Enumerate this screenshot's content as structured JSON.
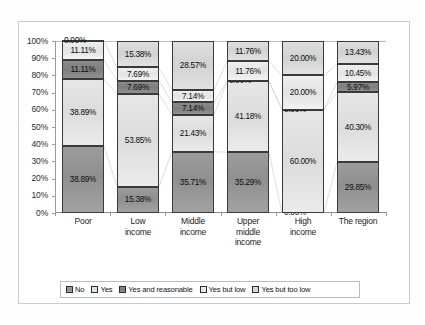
{
  "chart_data": {
    "type": "bar",
    "stacked": true,
    "title": "",
    "subtitle": "",
    "xlabel": "",
    "ylabel": "",
    "ylim": [
      0,
      100
    ],
    "grid": false,
    "legend_position": "bottom",
    "value_format": "percent",
    "categories": [
      "Poor",
      "Low income",
      "Middle income",
      "Upper middle income",
      "High income",
      "The region"
    ],
    "category_lines": [
      [
        "Poor"
      ],
      [
        "Low",
        "income"
      ],
      [
        "Middle",
        "income"
      ],
      [
        "Upper",
        "middle",
        "income"
      ],
      [
        "High",
        "income"
      ],
      [
        "The region"
      ]
    ],
    "ytick_labels": [
      "100%",
      "90%",
      "80%",
      "70%",
      "60%",
      "50%",
      "40%",
      "30%",
      "20%",
      "10%",
      "0%"
    ],
    "ytick_values": [
      100,
      90,
      80,
      70,
      60,
      50,
      40,
      30,
      20,
      10,
      0
    ],
    "series": [
      {
        "name": "No",
        "color": "#949494",
        "values": [
          38.89,
          15.38,
          35.71,
          35.29,
          0.0,
          29.85
        ],
        "labels": [
          "38.89%",
          "15.38%",
          "35.71%",
          "35.29%",
          "0.00%",
          "29.85%"
        ]
      },
      {
        "name": "Yes",
        "color": "#e2e2e2",
        "values": [
          38.89,
          53.85,
          21.43,
          41.18,
          60.0,
          40.3
        ],
        "labels": [
          "38.89%",
          "53.85%",
          "21.43%",
          "41.18%",
          "60.00%",
          "40.30%"
        ]
      },
      {
        "name": "Yes and reasonable",
        "color": "#858585",
        "values": [
          11.11,
          7.69,
          7.14,
          0.0,
          0.0,
          5.97
        ],
        "labels": [
          "11.11%",
          "7.69%",
          "7.14%",
          "0.00%",
          "0.00%",
          "5.97%"
        ]
      },
      {
        "name": "Yes but low",
        "color": "#ebebeb",
        "values": [
          11.11,
          7.69,
          7.14,
          11.76,
          20.0,
          10.45
        ],
        "labels": [
          "11.11%",
          "7.69%",
          "7.14%",
          "11.76%",
          "20.00%",
          "10.45%"
        ]
      },
      {
        "name": "Yes but too low",
        "color": "#d8d8d8",
        "values": [
          0.0,
          15.38,
          28.57,
          11.76,
          20.0,
          13.43
        ],
        "labels": [
          "0.00%",
          "15.38%",
          "28.57%",
          "11.76%",
          "20.00%",
          "13.43%"
        ]
      }
    ]
  },
  "legend": {
    "items": [
      {
        "label": "No"
      },
      {
        "label": "Yes"
      },
      {
        "label": "Yes and reasonable"
      },
      {
        "label": "Yes but low"
      },
      {
        "label": "Yes but too low"
      }
    ]
  }
}
